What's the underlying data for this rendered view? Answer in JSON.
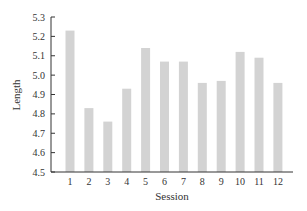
{
  "chart_data": {
    "type": "bar",
    "title": "",
    "xlabel": "Session",
    "ylabel": "Length",
    "categories": [
      "1",
      "2",
      "3",
      "4",
      "5",
      "6",
      "7",
      "8",
      "9",
      "10",
      "11",
      "12"
    ],
    "values": [
      5.23,
      4.83,
      4.76,
      4.93,
      5.14,
      5.07,
      5.07,
      4.96,
      4.97,
      5.12,
      5.09,
      4.96
    ],
    "ylim": [
      4.5,
      5.3
    ],
    "yticks": [
      "4.5",
      "4.6",
      "4.7",
      "4.8",
      "4.9",
      "5.0",
      "5.1",
      "5.2",
      "5.3"
    ],
    "grid": false,
    "legend": null,
    "bar_color": "#d3d3d3",
    "axis_color": "#333333"
  }
}
